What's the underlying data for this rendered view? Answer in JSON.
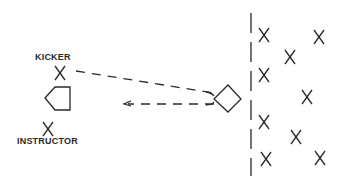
{
  "diagram": {
    "labels": {
      "kicker": "KICKER",
      "instructor": "INSTRUCTOR"
    },
    "colors": {
      "stroke": "#2a2a2a",
      "background": "#ffffff"
    },
    "elements": {
      "kicker_marker": "X",
      "instructor_marker": "X",
      "home_plate": "pentagon",
      "ball": "diamond",
      "wall": "vertical dashed line",
      "path_out": "dashed line from kicker to ball",
      "path_return": "dashed arrow from ball back toward kicker"
    },
    "fielders_count": 9
  }
}
